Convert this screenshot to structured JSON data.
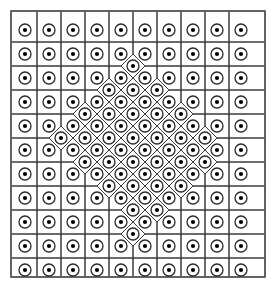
{
  "figure": {
    "type": "voronoi-lattice-diagram",
    "title": "",
    "caption": "",
    "canvas": {
      "width": 275,
      "height": 287
    },
    "frame": {
      "x": 11,
      "y": 11,
      "width": 254,
      "height": 266,
      "stroke": "#555555",
      "stroke_width": 1.6,
      "fill": "#ffffff"
    },
    "style": {
      "cell_stroke": "#3a3a3a",
      "cell_stroke_width": 1.0,
      "site_ring_stroke": "#2b2b2b",
      "site_ring_stroke_width": 1.3,
      "site_ring_radius": 6.0,
      "site_dot_fill": "#000000",
      "site_dot_radius": 2.1,
      "background": "#ffffff"
    },
    "chart_data": {
      "type": "scatter",
      "title": "",
      "xlabel": "",
      "ylabel": "",
      "xlim": [
        11,
        265
      ],
      "ylim": [
        11,
        277
      ],
      "grid": false,
      "legend": null,
      "notes": "Voronoi tessellation of a two-density point set: a coarse square lattice (pitch 24) over the whole square, replaced in the central rhombic region by a denser body-centred lattice (half-offset rows) that yields diamond-shaped cells.",
      "lattice": {
        "coarse_pitch": 24,
        "coarse_origin": [
          25,
          30
        ],
        "dense_pitch": 24,
        "dense_offset": 12,
        "dense_region": "rhombus centred at (138,144), half-diagonals 92 x 96"
      },
      "counts": {
        "total_sites": 168,
        "coarse_sites": 61,
        "dense_sites": 107
      }
    }
  }
}
